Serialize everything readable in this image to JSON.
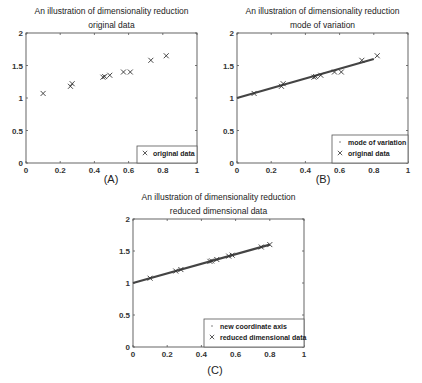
{
  "chart_data": [
    {
      "id": "A",
      "type": "scatter",
      "title": "An illustration of dimensionality reduction",
      "subtitle": "original data",
      "panel_label": "(A)",
      "xlabel": "",
      "ylabel": "",
      "xlim": [
        0,
        1
      ],
      "ylim": [
        0,
        2
      ],
      "xticks": [
        "0",
        "0.2",
        "0.4",
        "0.6",
        "0.8",
        "1"
      ],
      "yticks": [
        "0",
        "0.5",
        "1",
        "1.5",
        "2"
      ],
      "grid": false,
      "legend_position": "lower right",
      "series": [
        {
          "name": "original data",
          "marker": "x",
          "x": [
            0.1,
            0.26,
            0.27,
            0.45,
            0.46,
            0.49,
            0.57,
            0.61,
            0.73,
            0.82
          ],
          "y": [
            1.07,
            1.18,
            1.22,
            1.32,
            1.33,
            1.35,
            1.4,
            1.4,
            1.58,
            1.65
          ]
        }
      ]
    },
    {
      "id": "B",
      "type": "scatter",
      "title": "An illustration of dimensionality reduction",
      "subtitle": "mode of variation",
      "panel_label": "(B)",
      "xlabel": "",
      "ylabel": "",
      "xlim": [
        0,
        1
      ],
      "ylim": [
        0,
        2
      ],
      "xticks": [
        "0",
        "0.2",
        "0.4",
        "0.6",
        "0.8",
        "1"
      ],
      "yticks": [
        "0",
        "0.5",
        "1",
        "1.5",
        "2"
      ],
      "grid": false,
      "legend_position": "lower right",
      "series": [
        {
          "name": "mode of variation",
          "marker": "line",
          "x": [
            0,
            0.8
          ],
          "y": [
            1.0,
            1.6
          ]
        },
        {
          "name": "original data",
          "marker": "x",
          "x": [
            0.1,
            0.26,
            0.27,
            0.45,
            0.46,
            0.49,
            0.57,
            0.61,
            0.73,
            0.82
          ],
          "y": [
            1.07,
            1.18,
            1.22,
            1.32,
            1.33,
            1.35,
            1.4,
            1.4,
            1.58,
            1.65
          ]
        }
      ]
    },
    {
      "id": "C",
      "type": "scatter",
      "title": "An illustration of dimensionality reduction",
      "subtitle": "reduced dimensional data",
      "panel_label": "(C)",
      "xlabel": "",
      "ylabel": "",
      "xlim": [
        0,
        1
      ],
      "ylim": [
        0,
        2
      ],
      "xticks": [
        "0",
        "0.2",
        "0.4",
        "0.6",
        "0.8",
        "1"
      ],
      "yticks": [
        "0",
        "0.5",
        "1",
        "1.5",
        "2"
      ],
      "grid": false,
      "legend_position": "lower right",
      "series": [
        {
          "name": "new coordinate axis",
          "marker": "line",
          "x": [
            0,
            0.8
          ],
          "y": [
            1.0,
            1.6
          ]
        },
        {
          "name": "reduced dimensional data",
          "marker": "x",
          "x": [
            0.1,
            0.25,
            0.28,
            0.45,
            0.46,
            0.49,
            0.56,
            0.58,
            0.75,
            0.8
          ],
          "y": [
            1.075,
            1.1875,
            1.21,
            1.3375,
            1.345,
            1.3675,
            1.42,
            1.435,
            1.5625,
            1.6
          ]
        }
      ]
    }
  ]
}
